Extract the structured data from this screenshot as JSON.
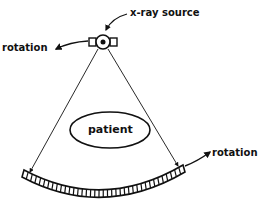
{
  "diagram": {
    "type": "ct-scanner-fan-beam",
    "labels": {
      "source": "x-ray source",
      "rotation_left": "rotation",
      "patient": "patient",
      "rotation_right": "rotation"
    },
    "colors": {
      "ink": "#111111",
      "background": "#ffffff"
    },
    "detector": {
      "element_count": 38
    }
  }
}
